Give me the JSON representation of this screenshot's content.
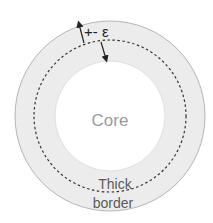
{
  "diagram": {
    "core_label": "Core",
    "border_label_line1": "Thick",
    "border_label_line2": "border",
    "epsilon_label": "+- ε",
    "colors": {
      "ring_fill": "#ececec",
      "ring_stroke": "#b5b5b5",
      "core_fill": "#ffffff",
      "dashed_stroke": "#333333",
      "arrow": "#222222",
      "core_text": "#9a9a9a",
      "border_text": "#5a5a5a",
      "epsilon_text": "#222222"
    }
  }
}
